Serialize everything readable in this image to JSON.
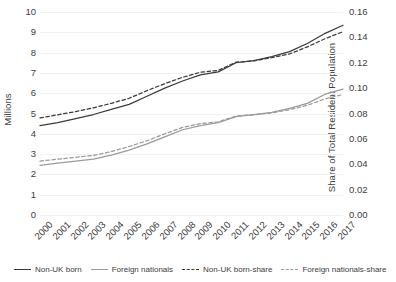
{
  "chart_data": {
    "type": "line",
    "title": "",
    "xlabel": "",
    "ylabel": "Millions",
    "y2label": "Share of Total Resident Population",
    "grid": true,
    "legend_position": "bottom",
    "x": [
      2000,
      2001,
      2002,
      2003,
      2004,
      2005,
      2006,
      2007,
      2008,
      2009,
      2010,
      2011,
      2012,
      2013,
      2014,
      2015,
      2016,
      2017
    ],
    "categories": [
      "2000",
      "2001",
      "2002",
      "2003",
      "2004",
      "2005",
      "2006",
      "2007",
      "2008",
      "2009",
      "2010",
      "2011",
      "2012",
      "2013",
      "2014",
      "2015",
      "2016",
      "2017"
    ],
    "ylim": [
      0,
      10
    ],
    "yticks": [
      "0",
      "1",
      "2",
      "3",
      "4",
      "5",
      "6",
      "7",
      "8",
      "9",
      "10"
    ],
    "y2lim": [
      0,
      0.16
    ],
    "y2ticks": [
      "0.00",
      "0.02",
      "0.04",
      "0.06",
      "0.08",
      "0.10",
      "0.12",
      "0.14",
      "0.16"
    ],
    "series": [
      {
        "name": "Non-UK born",
        "axis": "left",
        "style": "solid",
        "color": "#3b3b3b",
        "values": [
          4.4,
          4.55,
          4.75,
          4.95,
          5.2,
          5.45,
          5.85,
          6.25,
          6.6,
          6.9,
          7.05,
          7.5,
          7.6,
          7.8,
          8.05,
          8.45,
          8.95,
          9.35
        ]
      },
      {
        "name": "Foreign nationals",
        "axis": "left",
        "style": "solid",
        "color": "#9a9a9a",
        "values": [
          2.45,
          2.55,
          2.65,
          2.75,
          2.95,
          3.2,
          3.5,
          3.85,
          4.2,
          4.4,
          4.55,
          4.85,
          4.95,
          5.05,
          5.25,
          5.5,
          5.95,
          6.2
        ]
      },
      {
        "name": "Non-UK born-share",
        "axis": "right",
        "style": "dashed",
        "color": "#3b3b3b",
        "values": [
          0.0765,
          0.079,
          0.0815,
          0.0845,
          0.088,
          0.092,
          0.098,
          0.1035,
          0.1085,
          0.1125,
          0.114,
          0.1205,
          0.1215,
          0.124,
          0.127,
          0.1325,
          0.139,
          0.1445
        ]
      },
      {
        "name": "Foreign nationals-share",
        "axis": "right",
        "style": "dashed",
        "color": "#9a9a9a",
        "values": [
          0.0425,
          0.044,
          0.0455,
          0.047,
          0.05,
          0.054,
          0.0585,
          0.064,
          0.069,
          0.072,
          0.0735,
          0.078,
          0.079,
          0.0805,
          0.083,
          0.0865,
          0.0915,
          0.095
        ]
      }
    ]
  },
  "axes": {
    "left_title": "Millions",
    "right_title": "Share of Total Resident Population",
    "left_ticks": [
      "10",
      "9",
      "8",
      "7",
      "6",
      "5",
      "4",
      "3",
      "2",
      "1",
      "0"
    ],
    "right_ticks": [
      "0.16",
      "0.14",
      "0.12",
      "0.10",
      "0.08",
      "0.06",
      "0.04",
      "0.02",
      "0.00"
    ],
    "x_ticks": [
      "2000",
      "2001",
      "2002",
      "2003",
      "2004",
      "2005",
      "2006",
      "2007",
      "2008",
      "2009",
      "2010",
      "2011",
      "2012",
      "2013",
      "2014",
      "2015",
      "2016",
      "2017"
    ]
  },
  "legend": {
    "items": [
      {
        "label": "Non-UK born",
        "style": "solid",
        "color": "#3b3b3b"
      },
      {
        "label": "Foreign nationals",
        "style": "solid",
        "color": "#9a9a9a"
      },
      {
        "label": "Non-UK born-share",
        "style": "dashed",
        "color": "#3b3b3b"
      },
      {
        "label": "Foreign nationals-share",
        "style": "dashed",
        "color": "#9a9a9a"
      }
    ]
  },
  "colors": {
    "dark_line": "#3b3b3b",
    "gray_line": "#9a9a9a",
    "gridline": "#f1f1f1",
    "text": "#3d3d3d",
    "background": "#ffffff"
  }
}
